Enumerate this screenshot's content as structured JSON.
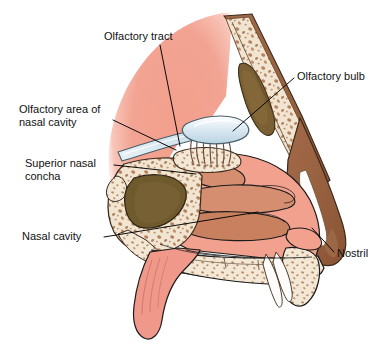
{
  "figure": {
    "background_color": "#ffffff",
    "width": 392,
    "height": 347,
    "type": "anatomical-illustration"
  },
  "labels": [
    {
      "id": "olfactory-tract",
      "text": "Olfactory tract",
      "x": 104,
      "y": 30,
      "leader_to_x": 178,
      "leader_to_y": 146
    },
    {
      "id": "olfactory-bulb",
      "text": "Olfactory bulb",
      "x": 297,
      "y": 70,
      "leader_to_x": 233,
      "leader_to_y": 131
    },
    {
      "id": "olfactory-area-of-nasal-cavity",
      "text": "Olfactory area of\nnasal cavity",
      "x": 19,
      "y": 103,
      "leader_to_x": 175,
      "leader_to_y": 150
    },
    {
      "id": "superior-nasal-concha",
      "text": "Superior nasal\nconcha",
      "x": 25,
      "y": 157,
      "leader_to_x": 196,
      "leader_to_y": 174
    },
    {
      "id": "nasal-cavity",
      "text": "Nasal cavity",
      "x": 22,
      "y": 230,
      "leader_to_x": 255,
      "leader_to_y": 213
    },
    {
      "id": "nostril",
      "text": "Nostril",
      "x": 337,
      "y": 247,
      "leader_to_x": 311,
      "leader_to_y": 228
    }
  ],
  "colors": {
    "background": "#ffffff",
    "brain_pink": "#f2a392",
    "brain_pink_light": "#f6b9ab",
    "mucosa_pink": "#f3a18f",
    "mucosa_pink_deep": "#ef9582",
    "turbinate_brown": "#d58e70",
    "turbinate_brown_dark": "#c8805f",
    "bone_cream": "#eee0cb",
    "bone_cream_light": "#f4ead9",
    "spongy_speck": "#a9724a",
    "sinus_dark": "#7b6033",
    "sinus_olive": "#6f5a2e",
    "skin_brown": "#9c6446",
    "skin_brown_dark": "#8a5334",
    "cartilage_white": "#fdfcfa",
    "olfactory_blue": "#cfe2ec",
    "olfactory_blue_edge": "#9fc0d3",
    "nerve_line": "#6b4a3a",
    "outline": "#1b1b1b",
    "leader_line": "#000000",
    "text": "#111111"
  },
  "structures": [
    {
      "id": "frontal-lobe-brain",
      "name": "Frontal lobe of brain",
      "color": "#f2a392"
    },
    {
      "id": "olfactory-bulb-body",
      "name": "Olfactory bulb",
      "color": "#cfe2ec"
    },
    {
      "id": "olfactory-tract-band",
      "name": "Olfactory tract",
      "color": "#cfe2ec"
    },
    {
      "id": "olfactory-nerve-filaments",
      "name": "Olfactory nerve filaments through cribriform plate",
      "color": "#6b4a3a"
    },
    {
      "id": "frontal-sinus",
      "name": "Frontal sinus",
      "color": "#7b6033"
    },
    {
      "id": "sphenoid-sinus",
      "name": "Sphenoid sinus",
      "color": "#6f5a2e"
    },
    {
      "id": "superior-concha",
      "name": "Superior nasal concha",
      "color": "#d58e70"
    },
    {
      "id": "middle-concha",
      "name": "Middle nasal concha",
      "color": "#d58e70"
    },
    {
      "id": "inferior-concha",
      "name": "Inferior nasal concha",
      "color": "#c8805f"
    },
    {
      "id": "hard-palate",
      "name": "Hard palate",
      "color": "#eee0cb"
    },
    {
      "id": "soft-palate-uvula",
      "name": "Soft palate and uvula",
      "color": "#f3a18f"
    },
    {
      "id": "nasal-dorsum",
      "name": "Nasal dorsum skin and bone",
      "color": "#9c6446"
    },
    {
      "id": "nostril-opening",
      "name": "Nostril",
      "color": "#f3a18f"
    },
    {
      "id": "airflow-arrows",
      "name": "Airflow arrows at nostril",
      "color": "#fdfcfa"
    },
    {
      "id": "spongy-bone",
      "name": "Spongy (cancellous) bone",
      "color": "#eee0cb"
    }
  ]
}
